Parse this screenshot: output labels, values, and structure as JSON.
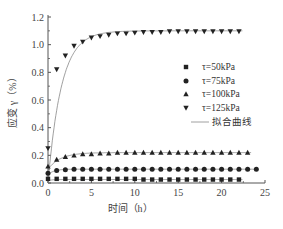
{
  "chart_data": {
    "type": "scatter",
    "title": "",
    "xlabel": "时间（h）",
    "ylabel": "应变 γ（%）",
    "xlim": [
      0,
      25
    ],
    "ylim": [
      0,
      1.2
    ],
    "xticks": [
      0,
      5,
      10,
      15,
      20,
      25
    ],
    "yticks": [
      0.0,
      0.2,
      0.4,
      0.6,
      0.8,
      1.0,
      1.2
    ],
    "ytick_labels": [
      "0.0",
      "0.2",
      "0.4",
      "0.6",
      "0.8",
      "1.0",
      "1.2"
    ],
    "grid": false,
    "legend_position": "right-center",
    "series": [
      {
        "name": "τ=50kPa",
        "marker": "square",
        "x": [
          0,
          1,
          2,
          3,
          4,
          5,
          6,
          7,
          8,
          9,
          10,
          11,
          12,
          13,
          14,
          15,
          16,
          17,
          18,
          19,
          20,
          21,
          22
        ],
        "y": [
          0.03,
          0.03,
          0.03,
          0.03,
          0.03,
          0.03,
          0.03,
          0.03,
          0.03,
          0.03,
          0.03,
          0.025,
          0.025,
          0.025,
          0.025,
          0.025,
          0.025,
          0.025,
          0.025,
          0.025,
          0.025,
          0.025,
          0.025
        ]
      },
      {
        "name": "τ=75kPa",
        "marker": "circle",
        "x": [
          0,
          1,
          2,
          3,
          4,
          5,
          6,
          7,
          8,
          9,
          10,
          11,
          12,
          13,
          14,
          15,
          16,
          17,
          18,
          19,
          20,
          21,
          22,
          23,
          24
        ],
        "y": [
          0.07,
          0.09,
          0.095,
          0.1,
          0.1,
          0.1,
          0.1,
          0.1,
          0.1,
          0.1,
          0.1,
          0.1,
          0.1,
          0.1,
          0.1,
          0.1,
          0.1,
          0.1,
          0.1,
          0.1,
          0.1,
          0.1,
          0.1,
          0.1,
          0.1
        ]
      },
      {
        "name": "τ=100kPa",
        "marker": "triangle-up",
        "x": [
          0,
          1,
          2,
          3,
          4,
          5,
          6,
          7,
          8,
          9,
          10,
          11,
          12,
          13,
          14,
          15,
          16,
          17,
          18,
          19,
          20,
          21,
          22,
          23
        ],
        "y": [
          0.12,
          0.17,
          0.19,
          0.2,
          0.21,
          0.21,
          0.215,
          0.215,
          0.22,
          0.22,
          0.22,
          0.22,
          0.22,
          0.22,
          0.22,
          0.22,
          0.22,
          0.22,
          0.22,
          0.22,
          0.22,
          0.22,
          0.22,
          0.22
        ]
      },
      {
        "name": "τ=125kPa",
        "marker": "triangle-down",
        "x": [
          0,
          1,
          2,
          3,
          4,
          5,
          6,
          7,
          8,
          9,
          10,
          11,
          12,
          13,
          14,
          15,
          16,
          17,
          18,
          19,
          20,
          21,
          22
        ],
        "y": [
          0.25,
          0.82,
          0.92,
          0.99,
          1.02,
          1.05,
          1.06,
          1.07,
          1.08,
          1.08,
          1.085,
          1.09,
          1.09,
          1.09,
          1.095,
          1.095,
          1.095,
          1.095,
          1.095,
          1.095,
          1.095,
          1.095,
          1.095
        ]
      },
      {
        "name": "拟合曲线",
        "marker": "line",
        "fits": [
          {
            "for": "τ=50kPa",
            "plateau": 0.025
          },
          {
            "for": "τ=75kPa",
            "plateau": 0.1
          },
          {
            "for": "τ=100kPa",
            "plateau": 0.22
          },
          {
            "for": "τ=125kPa",
            "plateau": 1.1
          }
        ]
      }
    ]
  },
  "legend": {
    "items": [
      {
        "marker": "square",
        "label": "τ=50kPa"
      },
      {
        "marker": "circle",
        "label": "τ=75kPa"
      },
      {
        "marker": "triangle-up",
        "label": "τ=100kPa"
      },
      {
        "marker": "triangle-down",
        "label": "τ=125kPa"
      },
      {
        "marker": "line",
        "label": "拟合曲线"
      }
    ]
  },
  "axes": {
    "xlabel": "时间（h）",
    "ylabel": "应变 γ（%）"
  },
  "colors": {
    "ink": "#222222",
    "axis": "#555555",
    "fit": "#888888"
  }
}
